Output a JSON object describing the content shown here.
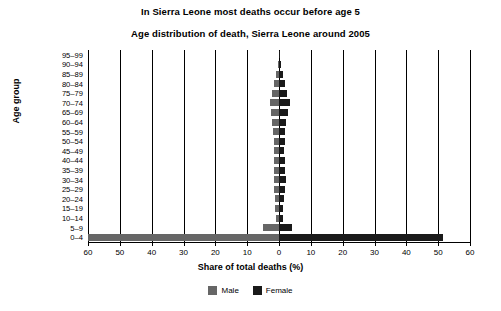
{
  "chart_data": {
    "type": "bar",
    "subtype": "population-pyramid",
    "title": "In Sierra Leone most deaths occur before age 5",
    "subtitle": "Age distribution of death, Sierra Leone around 2005",
    "xlabel": "Share of total deaths (%)",
    "ylabel": "Age group",
    "xlim": [
      -60,
      60
    ],
    "xticks": [
      60,
      50,
      40,
      30,
      20,
      10,
      0,
      10,
      20,
      30,
      40,
      50,
      60
    ],
    "grid": true,
    "legend_position": "bottom",
    "categories": [
      "95–99",
      "90–94",
      "85–89",
      "80–84",
      "75–79",
      "70–74",
      "65–69",
      "60–64",
      "55–59",
      "50–54",
      "45–49",
      "40–44",
      "35–39",
      "30–34",
      "25–29",
      "20–24",
      "15–19",
      "10–14",
      "5–9",
      "0–4"
    ],
    "series": [
      {
        "name": "Male",
        "color": "#666666",
        "direction": "left",
        "values": [
          0.1,
          0.4,
          0.9,
          1.5,
          2.2,
          2.9,
          2.4,
          2.1,
          1.9,
          1.7,
          1.5,
          1.5,
          1.6,
          1.6,
          1.5,
          1.3,
          1.1,
          1.0,
          5.0,
          60.0
        ]
      },
      {
        "name": "Female",
        "color": "#1a1a1a",
        "direction": "right",
        "values": [
          0.2,
          0.5,
          1.1,
          1.9,
          2.6,
          3.4,
          2.8,
          2.3,
          2.0,
          1.8,
          1.7,
          1.8,
          2.0,
          2.1,
          2.0,
          1.7,
          1.4,
          1.2,
          4.0,
          51.5
        ]
      }
    ]
  },
  "legend": {
    "male_label": "Male",
    "female_label": "Female"
  }
}
